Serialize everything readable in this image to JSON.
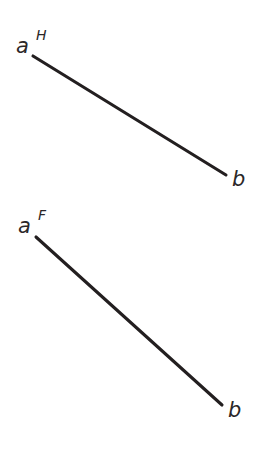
{
  "figure": {
    "background_color": "#ffffff",
    "ink_color": "#231f20",
    "width": 268,
    "height": 449,
    "views": [
      {
        "id": "horizontal-view",
        "view_code": "H",
        "start_label": "a",
        "start_superscript": "H",
        "end_label": "b",
        "end_superscript": "",
        "start_point": {
          "x": 33,
          "y": 56
        },
        "end_point": {
          "x": 226,
          "y": 175
        },
        "start_label_pos": {
          "x": 16,
          "y": 53
        },
        "start_sup_pos": {
          "x": 36,
          "y": 40
        },
        "end_label_pos": {
          "x": 232,
          "y": 186
        }
      },
      {
        "id": "frontal-view",
        "view_code": "F",
        "start_label": "a",
        "start_superscript": "F",
        "end_label": "b",
        "end_superscript": "",
        "start_point": {
          "x": 36,
          "y": 237
        },
        "end_point": {
          "x": 222,
          "y": 405
        },
        "start_label_pos": {
          "x": 18,
          "y": 233
        },
        "start_sup_pos": {
          "x": 38,
          "y": 220
        },
        "end_label_pos": {
          "x": 228,
          "y": 417
        }
      }
    ]
  }
}
